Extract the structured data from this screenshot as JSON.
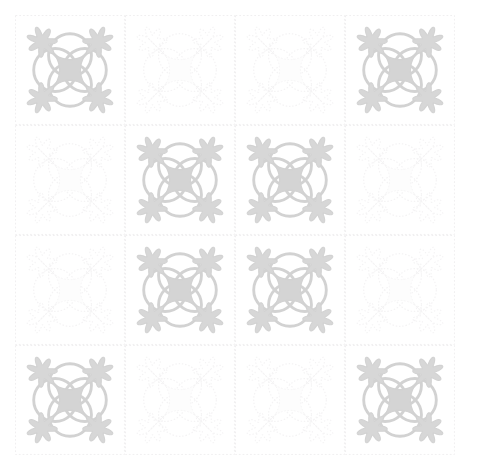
{
  "artwork": {
    "title": "Oak Leaf and Reel quilt block pattern",
    "kind": "repeating-quilt-block-grid",
    "background_color": "#ffffff",
    "canvas": {
      "width": 479,
      "height": 460
    },
    "grid": {
      "rows": 4,
      "columns": 4,
      "origin_x": 15,
      "origin_y": 15,
      "width": 440,
      "height": 433,
      "tile_width": 110,
      "tile_height": 108.25,
      "seam_line_color": "#f0eff0",
      "seam_line_style": "dotted"
    },
    "palette": {
      "motif_fill_strong": "#d7d7d7",
      "motif_stroke_strong": "#d2d2d2",
      "center_fill_strong": "#d4d4d4",
      "motif_fill_faint": "#fafafa",
      "motif_stroke_faint": "#f4f3f4",
      "center_fill_faint": "#fdfdfd",
      "seam_color": "#f1f0f1",
      "background": "#ffffff"
    },
    "motif": {
      "name": "oak-leaf-and-reel",
      "elements": [
        "four-overlapping-circles-reel",
        "concave-square-center",
        "four-corner-oak-leaves",
        "four-diagonal-stems"
      ],
      "circle_count": 4,
      "leaf_count": 4,
      "leaf_lobes": 7,
      "symmetry": "4-fold rotational"
    },
    "tiles": [
      {
        "row": 0,
        "col": 0,
        "variant": "strong"
      },
      {
        "row": 0,
        "col": 1,
        "variant": "faint"
      },
      {
        "row": 0,
        "col": 2,
        "variant": "faint"
      },
      {
        "row": 0,
        "col": 3,
        "variant": "strong"
      },
      {
        "row": 1,
        "col": 0,
        "variant": "faint"
      },
      {
        "row": 1,
        "col": 1,
        "variant": "strong"
      },
      {
        "row": 1,
        "col": 2,
        "variant": "strong"
      },
      {
        "row": 1,
        "col": 3,
        "variant": "faint"
      },
      {
        "row": 2,
        "col": 0,
        "variant": "faint"
      },
      {
        "row": 2,
        "col": 1,
        "variant": "strong"
      },
      {
        "row": 2,
        "col": 2,
        "variant": "strong"
      },
      {
        "row": 2,
        "col": 3,
        "variant": "faint"
      },
      {
        "row": 3,
        "col": 0,
        "variant": "strong"
      },
      {
        "row": 3,
        "col": 1,
        "variant": "faint"
      },
      {
        "row": 3,
        "col": 2,
        "variant": "faint"
      },
      {
        "row": 3,
        "col": 3,
        "variant": "strong"
      }
    ]
  }
}
